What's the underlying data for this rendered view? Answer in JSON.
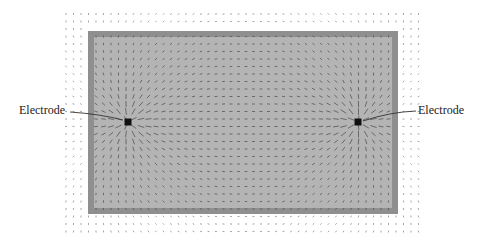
{
  "figure": {
    "type": "field-vector-diagram",
    "labels": {
      "left_electrode": "Electrode",
      "right_electrode": "Electrode"
    },
    "electrodes": [
      {
        "name": "left",
        "x": 128,
        "y": 122
      },
      {
        "name": "right",
        "x": 358,
        "y": 122
      }
    ],
    "domain_rect": {
      "x": 88,
      "y": 31,
      "width": 310,
      "height": 183,
      "border": 6
    },
    "colors": {
      "background": "#ffffff",
      "domain_fill": "#b4b4b4",
      "domain_border": "#8f8f8f",
      "vector": "#555555",
      "outer_vector": "#9a9a9a",
      "electrode": "#111111",
      "label": "#222222"
    }
  }
}
